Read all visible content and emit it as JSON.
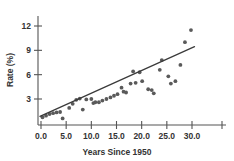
{
  "chart_data": {
    "type": "scatter",
    "title": "",
    "subtitle": "",
    "xlabel": "Years Since 1950",
    "ylabel": "Rate (%)",
    "xlim": [
      -1.5,
      33.5
    ],
    "ylim": [
      0,
      13.2
    ],
    "grid": false,
    "legend": null,
    "xticks": [
      0.0,
      5.0,
      10.0,
      15.0,
      20.0,
      25.0,
      30.0
    ],
    "xtick_labels": [
      "0.0",
      "5.0",
      "10.0",
      "15.0",
      "20.0",
      "25.0",
      "30.0"
    ],
    "yticks": [
      3,
      6,
      9,
      12
    ],
    "ytick_labels": [
      "3",
      "6",
      "9",
      "12"
    ],
    "marker": "filled-circle",
    "marker_color": "#5a5a5a",
    "point_count": 40,
    "points": [
      {
        "x": 0.3,
        "y": 0.75
      },
      {
        "x": 1.0,
        "y": 0.95
      },
      {
        "x": 1.7,
        "y": 1.15
      },
      {
        "x": 2.4,
        "y": 1.25
      },
      {
        "x": 3.1,
        "y": 1.35
      },
      {
        "x": 3.8,
        "y": 1.4
      },
      {
        "x": 4.3,
        "y": 0.6
      },
      {
        "x": 5.6,
        "y": 1.9
      },
      {
        "x": 6.3,
        "y": 2.4
      },
      {
        "x": 7.0,
        "y": 2.9
      },
      {
        "x": 7.7,
        "y": 3.05
      },
      {
        "x": 8.3,
        "y": 1.7
      },
      {
        "x": 9.0,
        "y": 2.95
      },
      {
        "x": 10.0,
        "y": 3.0
      },
      {
        "x": 10.4,
        "y": 2.5
      },
      {
        "x": 10.8,
        "y": 2.6
      },
      {
        "x": 11.5,
        "y": 2.6
      },
      {
        "x": 12.2,
        "y": 2.8
      },
      {
        "x": 13.0,
        "y": 3.0
      },
      {
        "x": 13.8,
        "y": 3.2
      },
      {
        "x": 14.5,
        "y": 3.4
      },
      {
        "x": 15.2,
        "y": 3.6
      },
      {
        "x": 16.0,
        "y": 4.4
      },
      {
        "x": 16.4,
        "y": 3.9
      },
      {
        "x": 16.9,
        "y": 3.8
      },
      {
        "x": 17.8,
        "y": 4.9
      },
      {
        "x": 18.3,
        "y": 6.4
      },
      {
        "x": 18.8,
        "y": 5.0
      },
      {
        "x": 19.6,
        "y": 6.3
      },
      {
        "x": 20.1,
        "y": 5.2
      },
      {
        "x": 21.3,
        "y": 4.2
      },
      {
        "x": 22.0,
        "y": 4.1
      },
      {
        "x": 22.4,
        "y": 3.7
      },
      {
        "x": 23.6,
        "y": 6.6
      },
      {
        "x": 24.0,
        "y": 7.8
      },
      {
        "x": 25.3,
        "y": 5.8
      },
      {
        "x": 25.8,
        "y": 4.9
      },
      {
        "x": 26.7,
        "y": 5.2
      },
      {
        "x": 27.7,
        "y": 7.2
      },
      {
        "x": 28.6,
        "y": 10.0
      },
      {
        "x": 29.8,
        "y": 11.5
      }
    ],
    "trend_line": {
      "type": "linear-fit",
      "x_start": -0.2,
      "y_start": 0.85,
      "x_end": 30.5,
      "y_end": 9.45,
      "slope": 0.28,
      "intercept": 0.9,
      "color": "#3a3a3a"
    }
  }
}
